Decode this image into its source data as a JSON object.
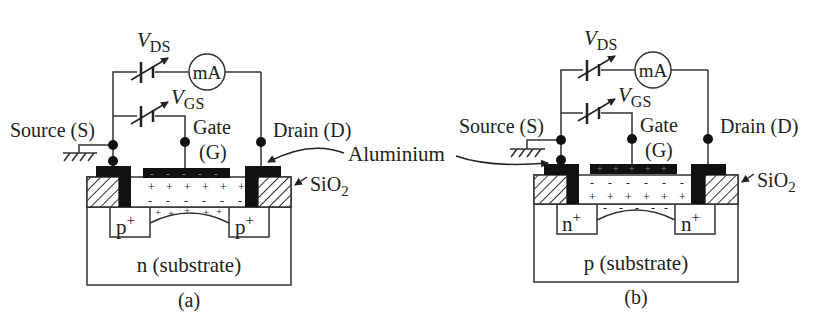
{
  "figure": {
    "shared_label": "Aluminium",
    "panels": [
      {
        "id": "a",
        "caption": "(a)",
        "substrate_label": "n (substrate)",
        "region_label": "p",
        "region_sup": "+",
        "source_label": "Source (S)",
        "gate_label_1": "Gate",
        "gate_label_2": "(G)",
        "drain_label": "Drain (D)",
        "oxide_label": "SiO",
        "oxide_sub": "2",
        "vds_main": "V",
        "vds_sub": "DS",
        "vgs_main": "V",
        "vgs_sub": "GS",
        "meter_label": "mA",
        "gate_charge": "-",
        "oxide_top_charge": "+",
        "oxide_bottom_charge": "-",
        "channel_charge": "+"
      },
      {
        "id": "b",
        "caption": "(b)",
        "substrate_label": "p (substrate)",
        "region_label": "n",
        "region_sup": "+",
        "source_label": "Source (S)",
        "gate_label_1": "Gate",
        "gate_label_2": "(G)",
        "drain_label": "Drain (D)",
        "oxide_label": "SiO",
        "oxide_sub": "2",
        "vds_main": "V",
        "vds_sub": "DS",
        "vgs_main": "V",
        "vgs_sub": "GS",
        "meter_label": "mA",
        "gate_charge": "+",
        "oxide_top_charge": "-",
        "oxide_bottom_charge": "+",
        "channel_charge": "-"
      }
    ],
    "colors": {
      "line": "#333333",
      "metal": "#111111",
      "text": "#222222",
      "background": "#ffffff"
    }
  }
}
